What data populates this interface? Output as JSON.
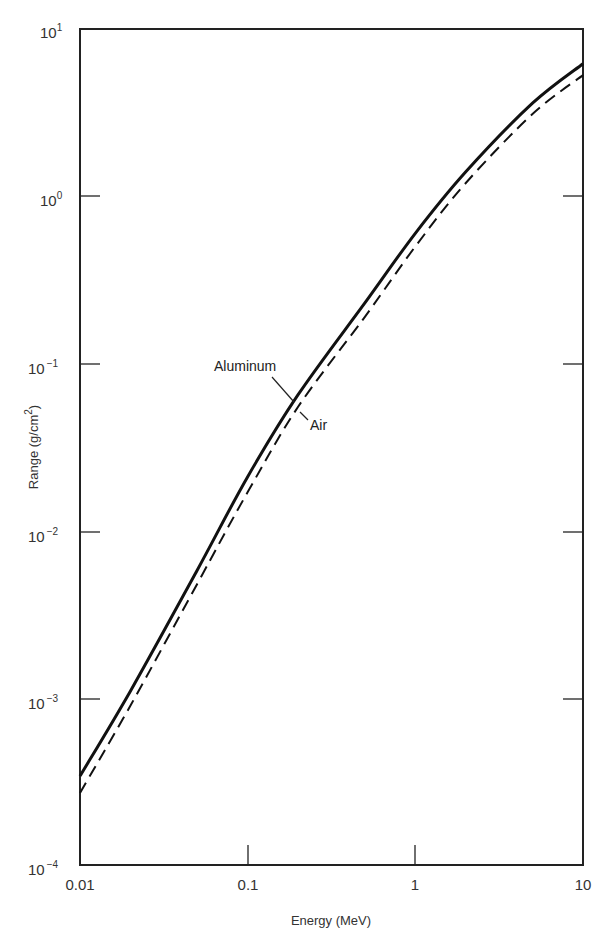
{
  "chart_data": {
    "type": "line",
    "title": "",
    "xlabel": "Energy (MeV)",
    "ylabel": "Range (g/cm2)",
    "xscale": "log",
    "yscale": "log",
    "xlim": [
      0.01,
      10
    ],
    "ylim": [
      0.0001,
      10
    ],
    "x_ticks": [
      "0.01",
      "0.1",
      "1",
      "10"
    ],
    "y_ticks": [
      {
        "base": "10",
        "exp": "1"
      },
      {
        "base": "10",
        "exp": "0"
      },
      {
        "base": "10",
        "exp": "−1"
      },
      {
        "base": "10",
        "exp": "−2"
      },
      {
        "base": "10",
        "exp": "−3"
      },
      {
        "base": "10",
        "exp": "−4"
      }
    ],
    "grid": false,
    "legend": "none (curves labeled inline)",
    "x": [
      0.01,
      0.02,
      0.05,
      0.1,
      0.2,
      0.5,
      1,
      2,
      5,
      10
    ],
    "series": [
      {
        "name": "Aluminum",
        "style": "solid",
        "values": [
          0.00034,
          0.0011,
          0.0058,
          0.021,
          0.065,
          0.23,
          0.6,
          1.4,
          3.6,
          6.2
        ]
      },
      {
        "name": "Air",
        "style": "dashed",
        "values": [
          0.00027,
          0.0009,
          0.0048,
          0.017,
          0.055,
          0.19,
          0.5,
          1.2,
          3.1,
          5.3
        ]
      }
    ],
    "annotations": [
      {
        "text": "Aluminum",
        "target": "solid curve near 0.2 MeV"
      },
      {
        "text": "Air",
        "target": "dashed curve near 0.2 MeV"
      }
    ]
  },
  "axes": {
    "x_title": "Energy (MeV)",
    "y_title_main": "Range (g/cm",
    "y_title_sup": "2",
    "y_title_close": ")"
  },
  "labels": {
    "aluminum": "Aluminum",
    "air": "Air"
  }
}
